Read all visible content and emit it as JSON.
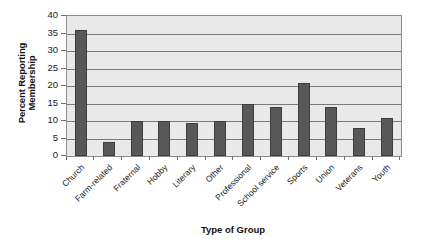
{
  "chart_data": {
    "type": "bar",
    "title": "",
    "subtitle": "",
    "xlabel": "Type of Group",
    "ylabel": "Percent Reporting Membership",
    "ylabel_lines": [
      "Percent Reporting",
      "Membership"
    ],
    "categories": [
      "Church",
      "Farm-related",
      "Fraternal",
      "Hobby",
      "Literary",
      "Other",
      "Professional",
      "School service",
      "Sports",
      "Union",
      "Veterans",
      "Youth"
    ],
    "values": [
      36,
      4,
      10,
      10,
      9.5,
      10,
      15,
      14,
      21,
      14,
      8,
      11
    ],
    "ylim": [
      0,
      40
    ],
    "yticks": [
      0,
      5,
      10,
      15,
      20,
      25,
      30,
      35,
      40
    ],
    "ytick_labels": [
      "0",
      "5",
      "10",
      "15",
      "20",
      "25",
      "30",
      "35",
      "40"
    ],
    "grid": "horizontal",
    "legend": "none",
    "bar_color": "#585858",
    "plot_background": "#e9e9e9",
    "gridline_color": "#7a7a7a",
    "axis_color": "#8d8d8d",
    "figure_background": "#ffffff"
  }
}
